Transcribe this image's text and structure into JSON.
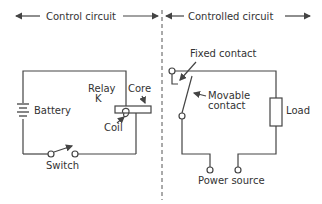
{
  "header": {
    "left_label": "Control circuit",
    "right_label": "Controlled circuit"
  },
  "control_circuit": {
    "battery_label": "Battery",
    "relay_label_line1": "Relay",
    "relay_label_line2": "K",
    "core_label": "Core",
    "coil_label": "Coil",
    "switch_label": "Switch"
  },
  "controlled_circuit": {
    "fixed_contact_label": "Fixed contact",
    "movable_contact_line1": "Movable",
    "movable_contact_line2": "contact",
    "load_label": "Load",
    "power_source_label": "Power source"
  },
  "colors": {
    "line": "#444444",
    "text": "#333333",
    "background": "#ffffff"
  }
}
